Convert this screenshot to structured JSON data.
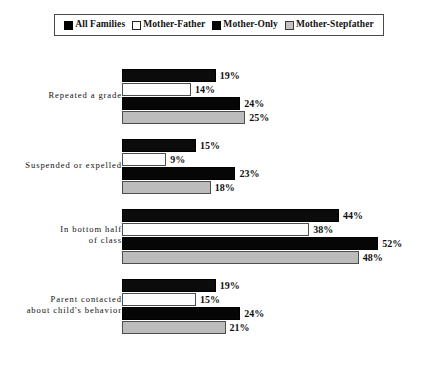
{
  "legend": {
    "items": [
      {
        "label": "All Families",
        "swatch": "black-swatch-icon",
        "color": "#0b0b0b"
      },
      {
        "label": "Mother-Father",
        "swatch": "white-swatch-icon",
        "color": "#ffffff"
      },
      {
        "label": "Mother-Only",
        "swatch": "black-swatch-icon",
        "color": "#060606"
      },
      {
        "label": "Mother-Stepfather",
        "swatch": "light-gray-swatch-icon",
        "color": "#bcbcbc"
      }
    ]
  },
  "caption": {
    "text": ""
  },
  "chart_data": {
    "type": "bar",
    "orientation": "horizontal",
    "title": "",
    "xlabel": "",
    "ylabel": "",
    "xlim": [
      0,
      56
    ],
    "grid": false,
    "legend_position": "top",
    "value_suffix": "%",
    "categories": [
      "Repeated a grade",
      "Suspended or expelled",
      "In bottom half of class",
      "Parent contacted about child's behavior"
    ],
    "category_lines": [
      [
        "Repeated a grade"
      ],
      [
        "Suspended or expelled"
      ],
      [
        "In bottom half",
        "of class"
      ],
      [
        "Parent contacted",
        "about child's behavior"
      ]
    ],
    "series": [
      {
        "name": "All Families",
        "values": [
          19,
          15,
          44,
          19
        ],
        "labels": [
          "19%",
          "15%",
          "44%",
          "19%"
        ]
      },
      {
        "name": "Mother-Father",
        "values": [
          14,
          9,
          38,
          15
        ],
        "labels": [
          "14%",
          "9%",
          "38%",
          "15%"
        ]
      },
      {
        "name": "Mother-Only",
        "values": [
          24,
          23,
          52,
          24
        ],
        "labels": [
          "24%",
          "23%",
          "52%",
          "24%"
        ]
      },
      {
        "name": "Mother-Stepfather",
        "values": [
          25,
          18,
          48,
          21
        ],
        "labels": [
          "25%",
          "18%",
          "48%",
          "21%"
        ]
      }
    ]
  }
}
